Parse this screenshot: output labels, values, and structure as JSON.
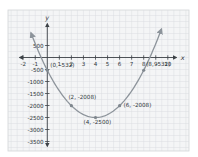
{
  "figure": {
    "bg": "#ffffff",
    "paper_bg": "#f4f5f6",
    "paper_border": "#d2d5d8",
    "grid_color": "#d9dcdf",
    "axis_color": "#3c4146",
    "curve_color": "#8d949b",
    "point_color": "#7e868d",
    "label_color": "#2f353a"
  },
  "chart_data": {
    "type": "line",
    "title": "",
    "xlabel": "x",
    "ylabel": "y",
    "grid": true,
    "x_ticks": [
      -2,
      -1,
      1,
      2,
      3,
      4,
      5,
      6,
      7,
      8,
      9,
      10
    ],
    "y_ticks": [
      500,
      -500,
      -1000,
      -1500,
      -2000,
      -2500,
      -3000,
      -3500
    ],
    "xlim": [
      -2.6,
      11
    ],
    "ylim": [
      -3900,
      1500
    ],
    "legend": "none",
    "points": [
      {
        "x": 0,
        "y": -532,
        "label": "(0, -532)"
      },
      {
        "x": 2,
        "y": -2008,
        "label": "(2, -2008)"
      },
      {
        "x": 4,
        "y": -2500,
        "label": "(4, -2500)"
      },
      {
        "x": 6,
        "y": -2008,
        "label": "(6, -2008)"
      },
      {
        "x": 8,
        "y": -532,
        "label": "(8, -532)"
      }
    ]
  }
}
